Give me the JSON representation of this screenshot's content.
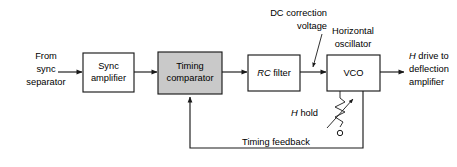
{
  "diagram": {
    "colors": {
      "line": "#1a1a1a",
      "shaded_block_fill": "#c9c9c9",
      "plain_block_fill": "#ffffff",
      "background": "#ffffff"
    },
    "blocks": [
      {
        "id": "sync-amplifier",
        "line1": "Sync",
        "line2": "amplifier",
        "shaded": false
      },
      {
        "id": "timing-comparator",
        "line1": "Timing",
        "line2": "comparator",
        "shaded": true
      },
      {
        "id": "rc-filter",
        "line1_italic": "RC",
        "line1_rest": " filter",
        "shaded": false
      },
      {
        "id": "vco",
        "line1": "VCO",
        "shaded": false
      }
    ],
    "labels": {
      "input_line1": "From",
      "input_line2": "sync",
      "input_line3": "separator",
      "dc_correction_line1": "DC correction",
      "dc_correction_line2": "voltage",
      "horizontal_osc_line1": "Horizontal",
      "horizontal_osc_line2": "oscillator",
      "output_line1_italic": "H",
      "output_line1_rest": " drive to",
      "output_line2": "deflection",
      "output_line3": "amplifier",
      "h_hold_italic": "H",
      "h_hold_rest": " hold",
      "timing_feedback": "Timing feedback"
    },
    "components": {
      "variable_resistor": "potentiometer"
    }
  }
}
